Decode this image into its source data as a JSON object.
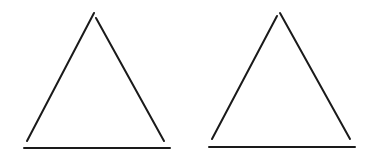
{
  "diagram": {
    "stroke_color": "#1a1a1a",
    "background": "#ffffff",
    "figures": [
      {
        "id": "triangle-left",
        "left_leg": {
          "x1": 27,
          "y1": 141,
          "x2": 94,
          "y2": 13
        },
        "right_leg": {
          "x1": 96,
          "y1": 18,
          "x2": 164,
          "y2": 141
        },
        "base": {
          "x1": 24,
          "y1": 148,
          "x2": 170,
          "y2": 148
        }
      },
      {
        "id": "triangle-right",
        "left_leg": {
          "x1": 212,
          "y1": 139,
          "x2": 277,
          "y2": 16
        },
        "right_leg": {
          "x1": 280,
          "y1": 13,
          "x2": 350,
          "y2": 139
        },
        "base": {
          "x1": 209,
          "y1": 147,
          "x2": 355,
          "y2": 147
        }
      }
    ]
  }
}
